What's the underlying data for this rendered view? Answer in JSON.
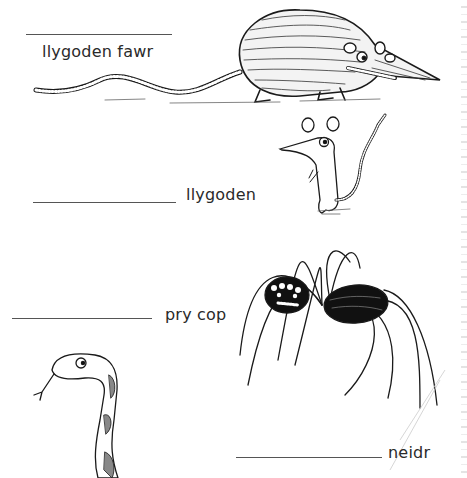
{
  "worksheet": {
    "items": [
      {
        "label": "llygoden fawr",
        "animal": "rat",
        "answer": ""
      },
      {
        "label": "llygoden",
        "animal": "mouse",
        "answer": ""
      },
      {
        "label": "pry cop",
        "animal": "spider",
        "answer": ""
      },
      {
        "label": "neidr",
        "animal": "snake",
        "answer": ""
      }
    ]
  }
}
